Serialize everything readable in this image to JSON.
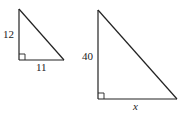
{
  "figure": {
    "triangles": [
      {
        "id": "small",
        "vertical_leg_label": "12",
        "horizontal_leg_label": "11",
        "right_angle_marker": true
      },
      {
        "id": "large",
        "vertical_leg_label": "40",
        "horizontal_leg_label": "x",
        "right_angle_marker": true
      }
    ]
  }
}
